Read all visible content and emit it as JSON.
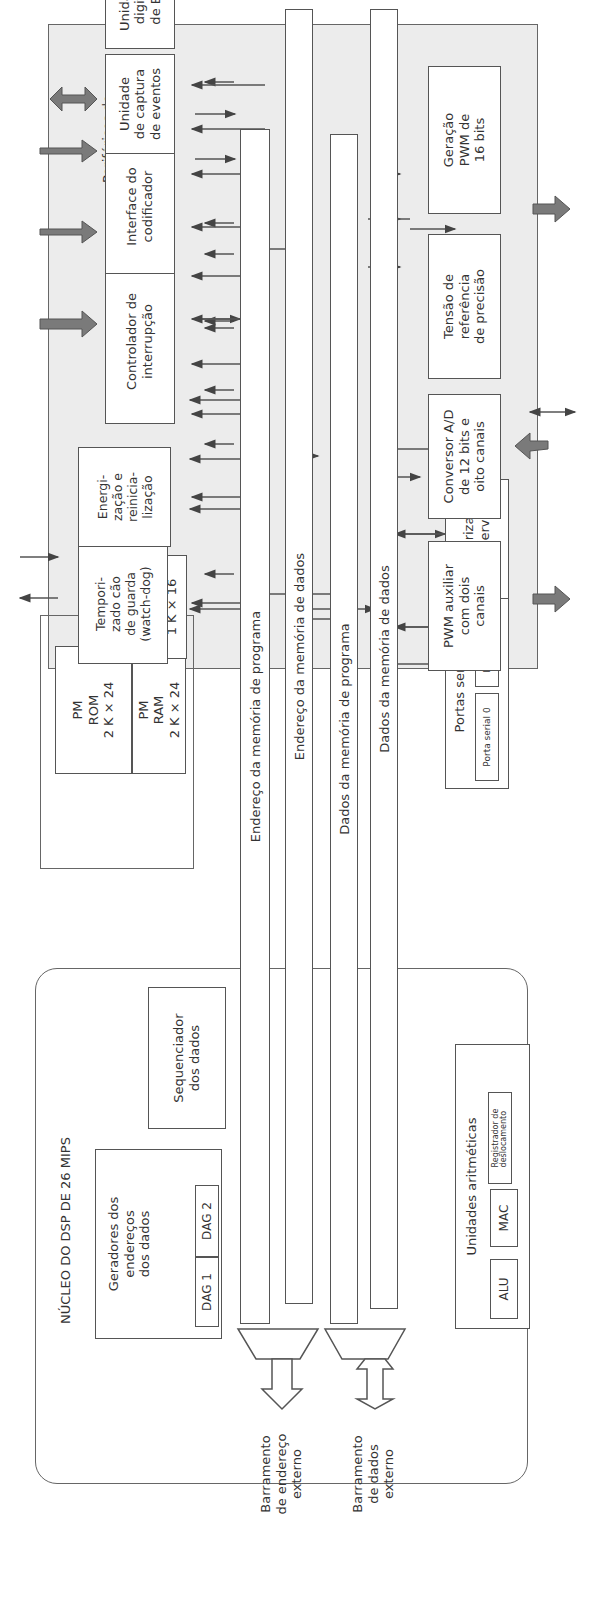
{
  "diagram": {
    "orientation": "rotated 90 degrees counter-clockwise",
    "dsp_core": {
      "title": "NÚCLEO DO DSP DE 26 MIPS",
      "dag_group": {
        "label": "Geradores dos\nendereços\ndos dados",
        "dag1": "DAG 1",
        "dag2": "DAG 2"
      },
      "sequencer": "Sequenciador\ndos dados",
      "arithmetic": {
        "label": "Unidades aritméticas",
        "alu": "ALU",
        "mac": "MAC",
        "shifter": "Registrador de\ndeslocamento"
      }
    },
    "buses": {
      "pm_address": "Endereço da memória de programa",
      "dm_address": "Endereço da memória de dados",
      "pm_data": "Dados da memória de programa",
      "dm_data": "Dados da memória de dados"
    },
    "external": {
      "address_bus": "Barramento\nde endereço\nexterno",
      "data_bus": "Barramento\nde dados\nexterno"
    },
    "memory": {
      "title": "Memória",
      "pm_rom": "PM\nROM\n2 K × 24",
      "pm_ram": "PM\nRAM\n2 K × 24",
      "dm_ram": "DM\nRAM\n1 K × 16"
    },
    "serial_ports": {
      "label": "Portas seriais",
      "port0": "Porta serial 0",
      "port1": "Porta serial 1"
    },
    "interval_timer": "Temporizador\nde intervalo",
    "motor_peripherals": {
      "title": "Periféricos de\ncontrole do motor",
      "watchdog": "Tempori-\nzado cão\nde guarda\n(watch-dog)",
      "power_reset": "Energi-\nzação e\nreinicia-\nlização",
      "interrupt_controller": "Controlador de\ninterrupção",
      "encoder_interface": "Interface do\ncodificador",
      "event_capture": "Unidade\nde captura\nde eventos",
      "digital_io": "Unidade\ndigital\nde E/S",
      "aux_pwm": "PWM auxiliar\ncom dois\ncanais",
      "adc": "Conversor A/D\nde 12 bits e\noito canais",
      "voltage_ref": "Tensão de\nreferência\nde precisão",
      "pwm16": "Geração\nPWM de\n16 bits"
    },
    "colors": {
      "line": "#555555",
      "peripheral_bg": "#ececec",
      "thick_arrow": "#7a7a7a"
    }
  }
}
